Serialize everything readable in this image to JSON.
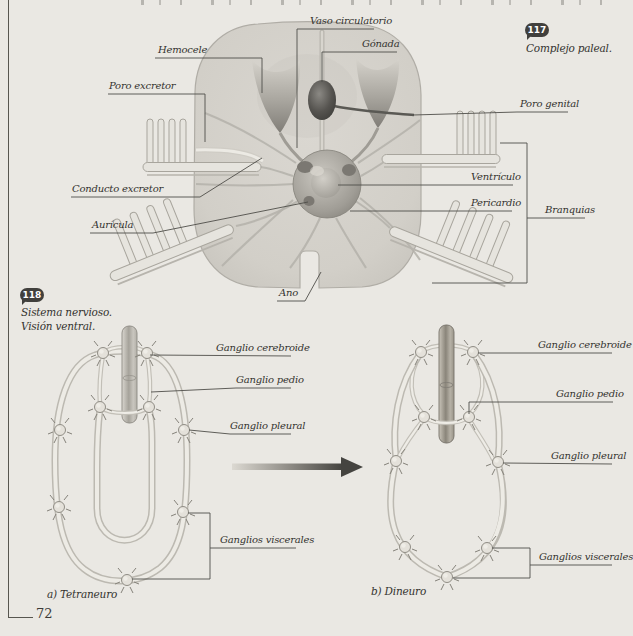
{
  "page": {
    "number": "72",
    "background": "#eae8e3"
  },
  "figure117": {
    "badge": "117",
    "caption": "Complejo paleal.",
    "labels": {
      "hemocele": "Hemocele",
      "poro_excretor": "Poro excretor",
      "vaso_circulatorio": "Vaso circulatorio",
      "gonada": "Gónada",
      "poro_genital": "Poro genital",
      "ventriculo": "Ventrículo",
      "pericardio": "Pericardio",
      "branquias": "Branquias",
      "conducto_excretor": "Conducto excretor",
      "auricula": "Aurícula",
      "ano": "Ano"
    }
  },
  "figure118": {
    "badge": "118",
    "caption_line1": "Sistema nervioso.",
    "caption_line2": "Visión ventral.",
    "labels": {
      "ganglio_cerebroide": "Ganglio cerebroide",
      "ganglio_pedio": "Ganglio pedio",
      "ganglio_pleural": "Ganglio pleural",
      "ganglios_viscerales": "Ganglios viscerales"
    },
    "caption_a": "a) Tetraneuro",
    "caption_b": "b) Dineuro"
  },
  "colors": {
    "ink": "#34332f",
    "line": "#4f4e49",
    "badge": "#41403d",
    "page_bg": "#eae8e3"
  }
}
